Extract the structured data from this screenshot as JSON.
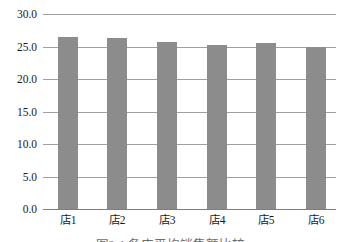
{
  "chart_data": {
    "type": "bar",
    "categories": [
      "店1",
      "店2",
      "店3",
      "店4",
      "店5",
      "店6"
    ],
    "values": [
      26.5,
      26.3,
      25.7,
      25.2,
      25.5,
      24.9
    ],
    "title": "",
    "xlabel": "",
    "ylabel": "",
    "ylim": [
      0,
      30
    ],
    "ytick_step": 5,
    "ytick_labels_top_to_bottom": [
      "30.0",
      "25.0",
      "20.0",
      "15.0",
      "10.0",
      "5.0",
      "0.0"
    ],
    "grid": true,
    "legend": false,
    "bar_color": "#8c8c8c",
    "gridline_color": "#a0a0a0",
    "axis_color": "#7f7f7f",
    "tick_text_color": "#1a1a1a"
  },
  "caption": {
    "text": "图2-1 各店平均销售额比较"
  }
}
